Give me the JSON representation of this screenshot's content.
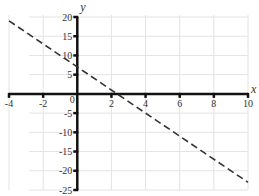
{
  "chart_data": {
    "type": "line",
    "title": "",
    "xlabel": "x",
    "ylabel": "y",
    "xlim": [
      -4,
      10
    ],
    "ylim": [
      -25,
      20
    ],
    "x_ticks": [
      -4,
      -2,
      0,
      2,
      4,
      6,
      8,
      10
    ],
    "y_ticks": [
      -25,
      -20,
      -15,
      -10,
      -5,
      0,
      5,
      10,
      15,
      20
    ],
    "x_tick_labels": [
      "-4",
      "-2",
      "0",
      "2",
      "4",
      "6",
      "8",
      "10"
    ],
    "y_tick_labels": [
      "-25",
      "-20",
      "-15",
      "-10",
      "-5",
      "0",
      "5",
      "10",
      "15",
      "20"
    ],
    "grid": true,
    "legend": null,
    "series": [
      {
        "name": "line",
        "style": "dashed",
        "equation": "y = -3x + 7",
        "x": [
          -4,
          10
        ],
        "y": [
          19,
          -23
        ],
        "color": "#333333"
      }
    ]
  },
  "colors": {
    "axis": "#111111",
    "grid": "#e3e3e3",
    "line": "#333333",
    "text": "#333333"
  }
}
